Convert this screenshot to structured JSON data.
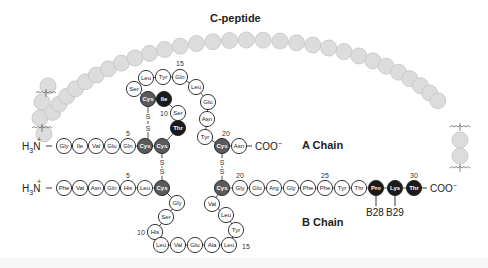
{
  "labels": {
    "c_peptide": "C-peptide",
    "a_chain": "A Chain",
    "b_chain": "B Chain",
    "a_n_term": "H3N+",
    "b_n_term": "H3N+",
    "a_c_term": "COO−",
    "b_c_term": "COO−",
    "b28": "B28",
    "b29": "B29"
  },
  "colors": {
    "normal_fill": "#ffffff",
    "cys_fill": "#5a5a5a",
    "highlight_fill": "#1a1a1a",
    "c_peptide_fill": "#dcdcdc",
    "c_peptide_stroke": "#c4c4c4",
    "stroke": "#222222"
  },
  "a_chain": [
    {
      "n": 1,
      "aa": "Gly",
      "x": 68,
      "y": 184,
      "t": "n"
    },
    {
      "n": 2,
      "aa": "Ile",
      "x": 85,
      "y": 184,
      "t": "n"
    },
    {
      "n": 3,
      "aa": "Val",
      "x": 102,
      "y": 184,
      "t": "n"
    },
    {
      "n": 4,
      "aa": "Glu",
      "x": 119,
      "y": 184,
      "t": "n"
    },
    {
      "n": 5,
      "aa": "Gln",
      "x": 136,
      "y": 184,
      "t": "n"
    },
    {
      "n": 6,
      "aa": "Cys",
      "x": 154,
      "y": 184,
      "t": "c"
    },
    {
      "n": 7,
      "aa": "Cys",
      "x": 172,
      "y": 184,
      "t": "c"
    },
    {
      "n": 8,
      "aa": "Thr",
      "x": 178,
      "y": 164,
      "t": "h"
    },
    {
      "n": 9,
      "aa": "Ser",
      "x": 181,
      "y": 144,
      "t": "n"
    },
    {
      "n": 10,
      "aa": "Ile",
      "x": 164,
      "y": 130,
      "t": "h"
    },
    {
      "n": 11,
      "aa": "Cys",
      "x": 148,
      "y": 130,
      "t": "c"
    },
    {
      "n": 12,
      "aa": "Ser",
      "x": 135,
      "y": 116,
      "t": "n"
    },
    {
      "n": 13,
      "aa": "Leu",
      "x": 148,
      "y": 102,
      "t": "n"
    },
    {
      "n": 14,
      "aa": "Tyr",
      "x": 166,
      "y": 100,
      "t": "n"
    },
    {
      "n": 15,
      "aa": "Gln",
      "x": 183,
      "y": 100,
      "t": "n"
    },
    {
      "n": 16,
      "aa": "Leu",
      "x": 198,
      "y": 114,
      "t": "n"
    },
    {
      "n": 17,
      "aa": "Glu",
      "x": 211,
      "y": 130,
      "t": "n"
    },
    {
      "n": 18,
      "aa": "Asn",
      "x": 211,
      "y": 148,
      "t": "n"
    },
    {
      "n": 19,
      "aa": "Tyr",
      "x": 209,
      "y": 166,
      "t": "n"
    },
    {
      "n": 20,
      "aa": "Cys",
      "x": 222,
      "y": 184,
      "t": "c"
    },
    {
      "n": 21,
      "aa": "Asn",
      "x": 239,
      "y": 184,
      "t": "n"
    }
  ],
  "b_chain": [
    {
      "n": 1,
      "aa": "Phe",
      "x": 68,
      "y": 243,
      "t": "n"
    },
    {
      "n": 2,
      "aa": "Val",
      "x": 85,
      "y": 243,
      "t": "n"
    },
    {
      "n": 3,
      "aa": "Asn",
      "x": 102,
      "y": 243,
      "t": "n"
    },
    {
      "n": 4,
      "aa": "Gln",
      "x": 119,
      "y": 243,
      "t": "n"
    },
    {
      "n": 5,
      "aa": "His",
      "x": 136,
      "y": 243,
      "t": "n"
    },
    {
      "n": 6,
      "aa": "Leu",
      "x": 154,
      "y": 243,
      "t": "n"
    },
    {
      "n": 7,
      "aa": "Cys",
      "x": 172,
      "y": 243,
      "t": "c"
    }
  ],
  "b_chain_row": {
    "y": 188,
    "items": []
  },
  "b_all": [
    {
      "n": 1,
      "aa": "Phe",
      "x": 68,
      "y": 188,
      "t": "n"
    },
    {
      "n": 2,
      "aa": "Val",
      "x": 85,
      "y": 188,
      "t": "n"
    },
    {
      "n": 3,
      "aa": "Asn",
      "x": 102,
      "y": 188,
      "t": "n"
    },
    {
      "n": 4,
      "aa": "Gln",
      "x": 119,
      "y": 188,
      "t": "n"
    },
    {
      "n": 5,
      "aa": "His",
      "x": 136,
      "y": 188,
      "t": "n"
    },
    {
      "n": 6,
      "aa": "Leu",
      "x": 154,
      "y": 188,
      "t": "n"
    },
    {
      "n": 7,
      "aa": "Cys",
      "x": 172,
      "y": 188,
      "t": "c"
    },
    {
      "n": 8,
      "aa": "Gly",
      "x": 180,
      "y": 205,
      "t": "n"
    },
    {
      "n": 9,
      "aa": "Ser",
      "x": 167,
      "y": 218,
      "t": "n"
    },
    {
      "n": 10,
      "aa": "His",
      "x": 155,
      "y": 234,
      "t": "n"
    },
    {
      "n": 11,
      "aa": "Leu",
      "x": 161,
      "y": 244,
      "t": "n"
    },
    {
      "n": 12,
      "aa": "Val",
      "x": 179,
      "y": 244,
      "t": "n"
    },
    {
      "n": 13,
      "aa": "Glu",
      "x": 196,
      "y": 244,
      "t": "n"
    },
    {
      "n": 14,
      "aa": "Ala",
      "x": 213,
      "y": 244,
      "t": "n"
    },
    {
      "n": 15,
      "aa": "Leu",
      "x": 230,
      "y": 244,
      "t": "n"
    },
    {
      "n": 16,
      "aa": "Tyr",
      "x": 236,
      "y": 228,
      "t": "n"
    },
    {
      "n": 17,
      "aa": "Leu",
      "x": 224,
      "y": 215,
      "t": "n"
    },
    {
      "n": 18,
      "aa": "Val",
      "x": 211,
      "y": 203,
      "t": "n"
    },
    {
      "n": 19,
      "aa": "Cys",
      "x": 222,
      "y": 188,
      "t": "c"
    },
    {
      "n": 20,
      "aa": "Gly",
      "x": 240,
      "y": 188,
      "t": "n"
    },
    {
      "n": 21,
      "aa": "Glu",
      "x": 257,
      "y": 188,
      "t": "n"
    },
    {
      "n": 22,
      "aa": "Arg",
      "x": 274,
      "y": 188,
      "t": "n"
    },
    {
      "n": 23,
      "aa": "Gly",
      "x": 291,
      "y": 188,
      "t": "n"
    },
    {
      "n": 24,
      "aa": "Phe",
      "x": 308,
      "y": 188,
      "t": "n"
    },
    {
      "n": 25,
      "aa": "Phe",
      "x": 325,
      "y": 188,
      "t": "n"
    },
    {
      "n": 26,
      "aa": "Tyr",
      "x": 342,
      "y": 188,
      "t": "n"
    },
    {
      "n": 27,
      "aa": "Thr",
      "x": 359,
      "y": 188,
      "t": "n"
    },
    {
      "n": 28,
      "aa": "Pro",
      "x": 376,
      "y": 188,
      "t": "h"
    },
    {
      "n": 29,
      "aa": "Lys",
      "x": 395,
      "y": 188,
      "t": "h"
    },
    {
      "n": 30,
      "aa": "Thr",
      "x": 414,
      "y": 188,
      "t": "h"
    }
  ],
  "residue_numbers": [
    {
      "label": "5",
      "x": 119,
      "y": 172
    },
    {
      "label": "10",
      "x": 164,
      "y": 146
    },
    {
      "label": "15",
      "x": 183,
      "y": 90
    },
    {
      "label": "20",
      "x": 224,
      "y": 168
    },
    {
      "label": "5",
      "x": 128,
      "y": 177
    },
    {
      "label": "20",
      "x": 240,
      "y": 177
    },
    {
      "label": "25",
      "x": 325,
      "y": 177
    },
    {
      "label": "30",
      "x": 414,
      "y": 177
    },
    {
      "label": "10",
      "x": 141,
      "y": 234
    },
    {
      "label": "15",
      "x": 245,
      "y": 248
    }
  ]
}
